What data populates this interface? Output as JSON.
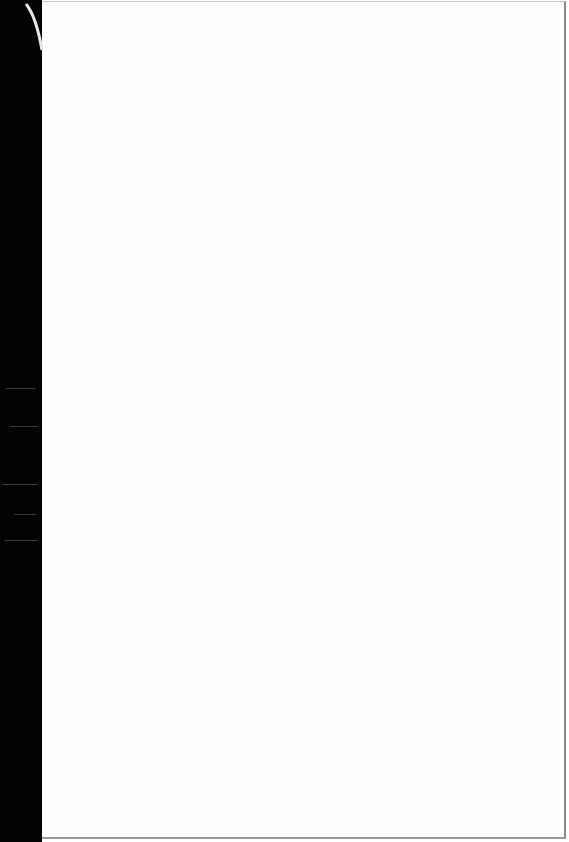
{
  "document": {
    "type": "scanned-page",
    "content": "",
    "colors": {
      "page": "#fefefe",
      "scanner_background": "#030303",
      "edge": "#8a8a8a"
    }
  }
}
